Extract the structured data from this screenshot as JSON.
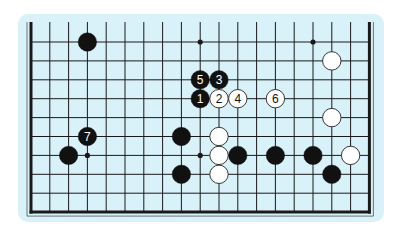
{
  "diagram": {
    "type": "go-board-fragment",
    "colors": {
      "page_background": "#ffffff",
      "panel_background": "#d9f1f8",
      "line": "#1a1a1a",
      "black_stone": "#111111",
      "white_stone": "#ffffff",
      "white_stone_outline": "#222222"
    },
    "grid": {
      "columns": 19,
      "rows_visible": 10,
      "origin_x": 31,
      "origin_y": 42,
      "step_x": 18.8,
      "step_y": 18.9,
      "top_open": true,
      "edges": [
        "left",
        "right",
        "bottom"
      ]
    },
    "star_points": [
      {
        "col": 9,
        "row": 0
      },
      {
        "col": 15,
        "row": 0
      },
      {
        "col": 3,
        "row": 6
      },
      {
        "col": 9,
        "row": 6
      }
    ],
    "stones": [
      {
        "color": "black",
        "col": 3,
        "row": 0,
        "label": ""
      },
      {
        "color": "black",
        "col": 9,
        "row": 2,
        "label": "5"
      },
      {
        "color": "black",
        "col": 10,
        "row": 2,
        "label": "3"
      },
      {
        "color": "black",
        "col": 9,
        "row": 3,
        "label": "1"
      },
      {
        "color": "white",
        "col": 10,
        "row": 3,
        "label": "2"
      },
      {
        "color": "white",
        "col": 11,
        "row": 3,
        "label": "4"
      },
      {
        "color": "white",
        "col": 13,
        "row": 3,
        "label": "6"
      },
      {
        "color": "white",
        "col": 16,
        "row": 1,
        "label": ""
      },
      {
        "color": "white",
        "col": 16,
        "row": 4,
        "label": ""
      },
      {
        "color": "black",
        "col": 3,
        "row": 5,
        "label": "7"
      },
      {
        "color": "black",
        "col": 2,
        "row": 6,
        "label": ""
      },
      {
        "color": "black",
        "col": 8,
        "row": 5,
        "label": ""
      },
      {
        "color": "black",
        "col": 8,
        "row": 7,
        "label": ""
      },
      {
        "color": "white",
        "col": 10,
        "row": 5,
        "label": ""
      },
      {
        "color": "white",
        "col": 10,
        "row": 6,
        "label": ""
      },
      {
        "color": "white",
        "col": 10,
        "row": 7,
        "label": ""
      },
      {
        "color": "black",
        "col": 11,
        "row": 6,
        "label": ""
      },
      {
        "color": "black",
        "col": 13,
        "row": 6,
        "label": ""
      },
      {
        "color": "black",
        "col": 15,
        "row": 6,
        "label": ""
      },
      {
        "color": "white",
        "col": 17,
        "row": 6,
        "label": ""
      },
      {
        "color": "black",
        "col": 16,
        "row": 7,
        "label": ""
      }
    ]
  }
}
